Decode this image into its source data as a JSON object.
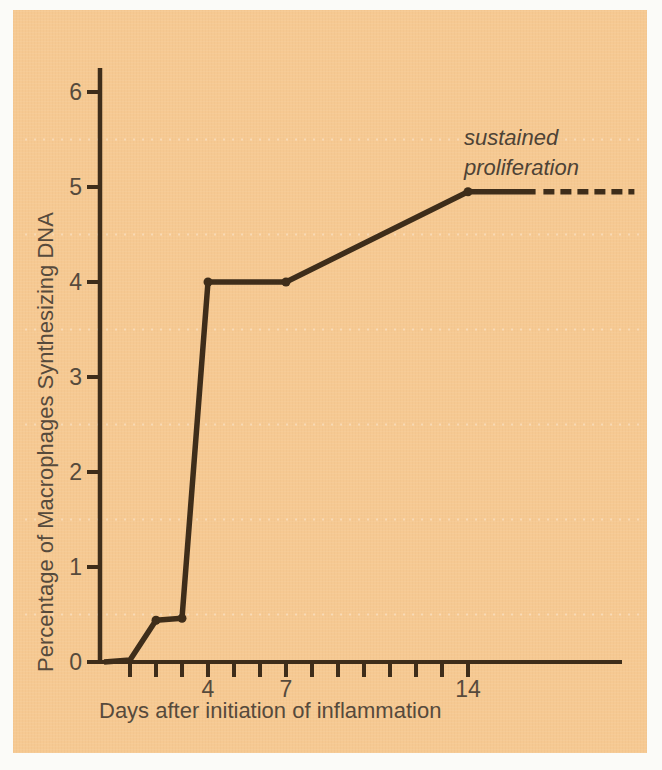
{
  "figure": {
    "panel_background_color": "#f6c992",
    "page_border_color": "#fbfbf8",
    "line_color": "#3e2d1a",
    "text_color": "#564a3c",
    "annotation": {
      "line1": "sustained",
      "line2": "proliferation"
    }
  },
  "chart_data": {
    "type": "line",
    "title": "",
    "xlabel": "Days after initiation of inflammation",
    "ylabel": "Percentage of Macrophages Synthesizing DNA",
    "xlim": [
      0,
      20
    ],
    "ylim": [
      0,
      6.3
    ],
    "grid": false,
    "legend": false,
    "y_ticks": [
      0,
      1,
      2,
      3,
      4,
      5,
      6
    ],
    "x_minor_ticks": [
      1,
      2,
      3,
      4,
      5,
      6,
      7,
      8,
      9,
      10,
      11,
      12,
      13,
      14
    ],
    "x_tick_labels": [
      {
        "x": 4,
        "label": "4"
      },
      {
        "x": 7,
        "label": "7"
      },
      {
        "x": 14,
        "label": "14"
      }
    ],
    "series": [
      {
        "name": "percentage of macrophages synthesizing DNA",
        "style": "solid",
        "points": [
          [
            0,
            0
          ],
          [
            1,
            0.02
          ],
          [
            2,
            0.44
          ],
          [
            3,
            0.46
          ],
          [
            4,
            4.0
          ],
          [
            7,
            4.0
          ],
          [
            14,
            4.95
          ],
          [
            16.6,
            4.95
          ]
        ]
      }
    ],
    "dashed_extension": [
      [
        16.9,
        4.95
      ],
      [
        20.4,
        4.95
      ]
    ],
    "marker_points": [
      [
        2,
        0.44
      ],
      [
        3,
        0.46
      ],
      [
        4,
        4.0
      ],
      [
        7,
        4.0
      ],
      [
        14,
        4.95
      ]
    ],
    "annotation": {
      "text": "sustained proliferation",
      "near_x": 14,
      "near_y": 5.5,
      "style": "italic"
    },
    "faint_halftone_rows_at_values": [
      0.5,
      1.5,
      2.5,
      3.5,
      4.5,
      5.5
    ]
  }
}
